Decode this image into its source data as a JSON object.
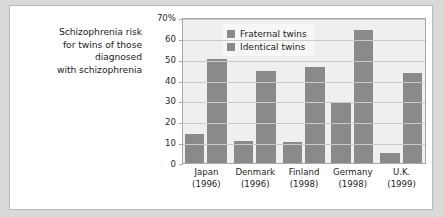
{
  "caption": {
    "lines": [
      "Schizophrenia risk",
      "for twins of those",
      "diagnosed",
      "with schizophrenia"
    ]
  },
  "legend": {
    "position": "top-left-inside",
    "items": [
      {
        "label": "Fraternal twins",
        "color": "#8a8a8a"
      },
      {
        "label": "Identical twins",
        "color": "#8a8a8a"
      }
    ]
  },
  "chart_data": {
    "type": "bar",
    "title": "Schizophrenia risk for twins of those diagnosed with schizophrenia",
    "xlabel": "",
    "ylabel": "",
    "ylim": [
      0,
      70
    ],
    "yticks": [
      0,
      10,
      20,
      30,
      40,
      50,
      60,
      70
    ],
    "ytick_labels": [
      "0",
      "10",
      "20",
      "30",
      "40",
      "50",
      "60",
      "70%"
    ],
    "grid": true,
    "categories": [
      "Japan",
      "Denmark",
      "Finland",
      "Germany",
      "U.K."
    ],
    "category_years": [
      "(1996)",
      "(1996)",
      "(1998)",
      "(1998)",
      "(1999)"
    ],
    "series": [
      {
        "name": "Fraternal twins",
        "color": "#8a8a8a",
        "values": [
          14,
          10.5,
          10,
          29,
          5
        ]
      },
      {
        "name": "Identical twins",
        "color": "#8a8a8a",
        "values": [
          50,
          44,
          46,
          64,
          43
        ]
      }
    ]
  }
}
